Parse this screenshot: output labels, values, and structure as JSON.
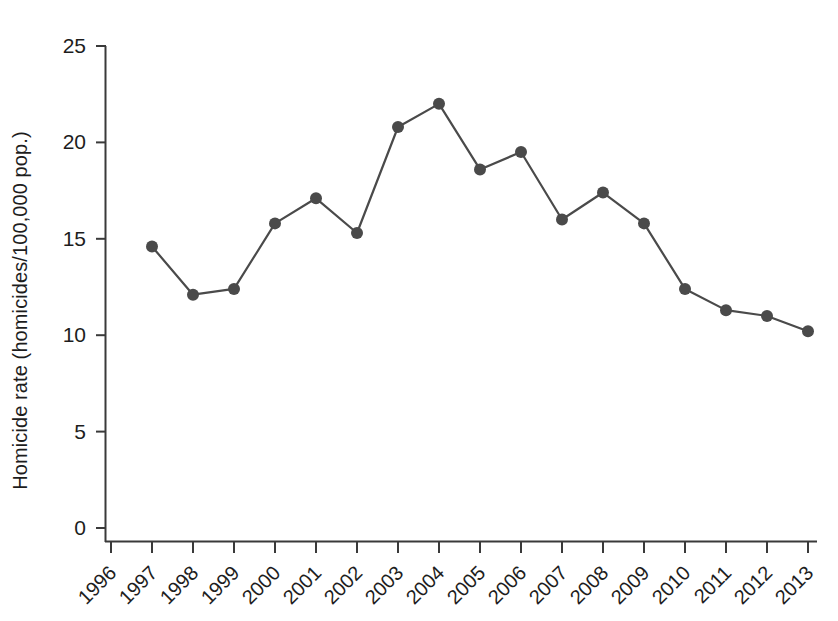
{
  "chart_data": {
    "type": "line",
    "title": "",
    "subtitle": "",
    "xlabel": "",
    "ylabel": "Homicide rate (homicides/100,000 pop.)",
    "categories": [
      "1996",
      "1997",
      "1998",
      "1999",
      "2000",
      "2001",
      "2002",
      "2003",
      "2004",
      "2005",
      "2006",
      "2007",
      "2008",
      "2009",
      "2010",
      "2011",
      "2012",
      "2013"
    ],
    "x": [
      1996,
      1997,
      1998,
      1999,
      2000,
      2001,
      2002,
      2003,
      2004,
      2005,
      2006,
      2007,
      2008,
      2009,
      2010,
      2011,
      2012,
      2013
    ],
    "values": [
      null,
      14.6,
      12.1,
      12.4,
      15.8,
      17.1,
      15.3,
      20.8,
      22.0,
      18.6,
      19.5,
      16.0,
      17.4,
      15.8,
      12.4,
      11.3,
      11.0,
      10.2
    ],
    "series": [
      {
        "name": "Homicide rate",
        "values": [
          null,
          14.6,
          12.1,
          12.4,
          15.8,
          17.1,
          15.3,
          20.8,
          22.0,
          18.6,
          19.5,
          16.0,
          17.4,
          15.8,
          12.4,
          11.3,
          11.0,
          10.2
        ]
      }
    ],
    "ylim": [
      0,
      25
    ],
    "yticks": [
      0,
      5,
      10,
      15,
      20,
      25
    ],
    "ytick_labels": [
      "0",
      "5",
      "10",
      "15",
      "20",
      "25"
    ],
    "xtick_labels": [
      "1996",
      "1997",
      "1998",
      "1999",
      "2000",
      "2001",
      "2002",
      "2003",
      "2004",
      "2005",
      "2006",
      "2007",
      "2008",
      "2009",
      "2010",
      "2011",
      "2012",
      "2013"
    ],
    "xtick_rotation": -45,
    "grid": false,
    "legend": "none",
    "marker": "circle",
    "marker_color": "#4a4a4a",
    "line_color": "#4a4a4a",
    "axis_color": "#3a3a3a",
    "background_color": "#ffffff"
  },
  "axes": {
    "y_axis_label": "Homicide rate (homicides/100,000 pop.)"
  }
}
